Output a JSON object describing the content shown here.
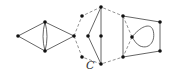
{
  "diagram": {
    "label": "C",
    "colors": {
      "edge": "#555555",
      "dashed": "#777777",
      "vertex": "#111111"
    },
    "components": [
      {
        "name": "diamond-with-double-edge"
      },
      {
        "name": "dashed-cycle-C"
      },
      {
        "name": "quadrilateral-with-loop"
      }
    ]
  }
}
